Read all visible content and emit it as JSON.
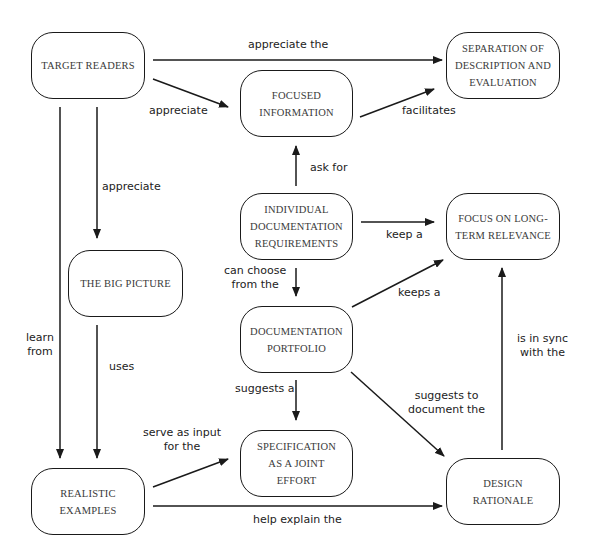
{
  "diagram": {
    "colors": {
      "stroke": "#1a1a1a",
      "node_text": "#3a3a3a",
      "label_text": "#222222",
      "background": "#ffffff"
    },
    "nodes": {
      "target_readers": "TARGET READERS",
      "separation": "SEPARATION OF\nDESCRIPTION AND\nEVALUATION",
      "focused_information": "FOCUSED\nINFORMATION",
      "individual_requirements": "INDIVIDUAL\nDOCUMENTATION\nREQUIREMENTS",
      "focus_long_term": "FOCUS ON LONG-\nTERM RELEVANCE",
      "big_picture": "THE BIG PICTURE",
      "documentation_portfolio": "DOCUMENTATION\nPORTFOLIO",
      "specification": "SPECIFICATION\nAS A JOINT\nEFFORT",
      "realistic_examples": "REALISTIC\nEXAMPLES",
      "design_rationale": "DESIGN\nRATIONALE"
    },
    "edges": [
      {
        "from": "TARGET READERS",
        "to": "SEPARATION OF DESCRIPTION AND EVALUATION",
        "label": "appreciate the"
      },
      {
        "from": "TARGET READERS",
        "to": "FOCUSED INFORMATION",
        "label": "appreciate"
      },
      {
        "from": "FOCUSED INFORMATION",
        "to": "SEPARATION OF DESCRIPTION AND EVALUATION",
        "label": "facilitates"
      },
      {
        "from": "INDIVIDUAL DOCUMENTATION REQUIREMENTS",
        "to": "FOCUSED INFORMATION",
        "label": "ask for"
      },
      {
        "from": "TARGET READERS",
        "to": "THE BIG PICTURE",
        "label": "appreciate"
      },
      {
        "from": "INDIVIDUAL DOCUMENTATION REQUIREMENTS",
        "to": "FOCUS ON LONG-TERM RELEVANCE",
        "label": "keep a"
      },
      {
        "from": "INDIVIDUAL DOCUMENTATION REQUIREMENTS",
        "to": "DOCUMENTATION PORTFOLIO",
        "label": "can choose\nfrom the"
      },
      {
        "from": "DOCUMENTATION PORTFOLIO",
        "to": "FOCUS ON LONG-TERM RELEVANCE",
        "label": "keeps a"
      },
      {
        "from": "TARGET READERS",
        "to": "REALISTIC EXAMPLES",
        "label": "learn\nfrom"
      },
      {
        "from": "THE BIG PICTURE",
        "to": "REALISTIC EXAMPLES",
        "label": "uses"
      },
      {
        "from": "DESIGN RATIONALE",
        "to": "FOCUS ON LONG-TERM RELEVANCE",
        "label": "is in sync\nwith the"
      },
      {
        "from": "DOCUMENTATION PORTFOLIO",
        "to": "SPECIFICATION AS A JOINT EFFORT",
        "label": "suggests a"
      },
      {
        "from": "DOCUMENTATION PORTFOLIO",
        "to": "DESIGN RATIONALE",
        "label": "suggests to\ndocument the"
      },
      {
        "from": "REALISTIC EXAMPLES",
        "to": "SPECIFICATION AS A JOINT EFFORT",
        "label": "serve as input\nfor the"
      },
      {
        "from": "REALISTIC EXAMPLES",
        "to": "DESIGN RATIONALE",
        "label": "help explain the"
      }
    ]
  }
}
